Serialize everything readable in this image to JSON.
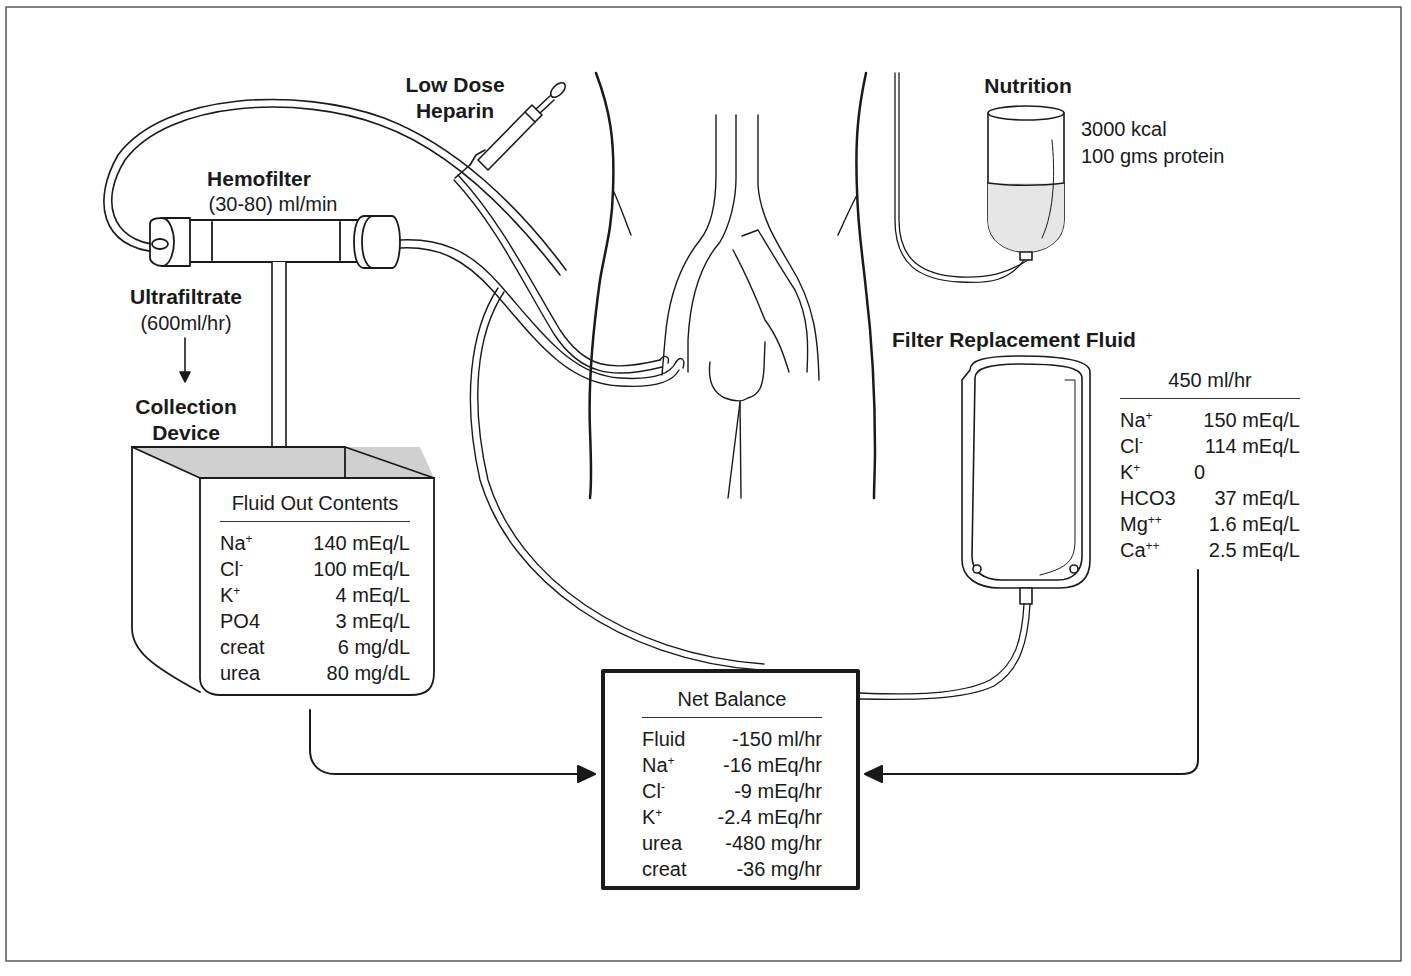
{
  "labels": {
    "heparin": [
      "Low  Dose",
      "Heparin"
    ],
    "hemofilter_title": "Hemofilter",
    "hemofilter_rate": "(30-80) ml/min",
    "ultrafiltrate_title": "Ultrafiltrate",
    "ultrafiltrate_rate": "(600ml/hr)",
    "collection_device": [
      "Collection",
      "Device"
    ],
    "nutrition_title": "Nutrition",
    "nutrition_kcal": "3000 kcal",
    "nutrition_protein": "100 gms protein",
    "replacement_title": "Filter Replacement Fluid"
  },
  "fluid_out": {
    "title": "Fluid Out Contents",
    "rows": [
      {
        "name": "Na",
        "charge": "+",
        "value": "140 mEq/L"
      },
      {
        "name": "Cl",
        "charge": "-",
        "value": "100 mEq/L"
      },
      {
        "name": "K",
        "charge": "+",
        "value": "4 mEq/L"
      },
      {
        "name": "PO4",
        "charge": "",
        "value": "3 mEq/L"
      },
      {
        "name": "creat",
        "charge": "",
        "value": "6 mg/dL"
      },
      {
        "name": "urea",
        "charge": "",
        "value": "80 mg/dL"
      }
    ]
  },
  "replacement_fluid": {
    "title": "450 ml/hr",
    "rows": [
      {
        "name": "Na",
        "charge": "+",
        "value": "150 mEq/L"
      },
      {
        "name": "Cl",
        "charge": "-",
        "value": "114 mEq/L"
      },
      {
        "name": "K",
        "charge": "+",
        "value": "0"
      },
      {
        "name": "HCO3",
        "charge": "",
        "value": "37 mEq/L"
      },
      {
        "name": "Mg",
        "charge": "++",
        "value": "1.6 mEq/L"
      },
      {
        "name": "Ca",
        "charge": "++",
        "value": "2.5 mEq/L"
      }
    ]
  },
  "net_balance": {
    "title": "Net Balance",
    "rows": [
      {
        "name": "Fluid",
        "charge": "",
        "value": "-150 ml/hr"
      },
      {
        "name": "Na",
        "charge": "+",
        "value": "-16 mEq/hr"
      },
      {
        "name": "Cl",
        "charge": "-",
        "value": "-9 mEq/hr"
      },
      {
        "name": "K",
        "charge": "+",
        "value": "-2.4 mEq/hr"
      },
      {
        "name": "urea",
        "charge": "",
        "value": "-480 mg/hr"
      },
      {
        "name": "creat",
        "charge": "",
        "value": "-36 mg/hr"
      }
    ]
  }
}
